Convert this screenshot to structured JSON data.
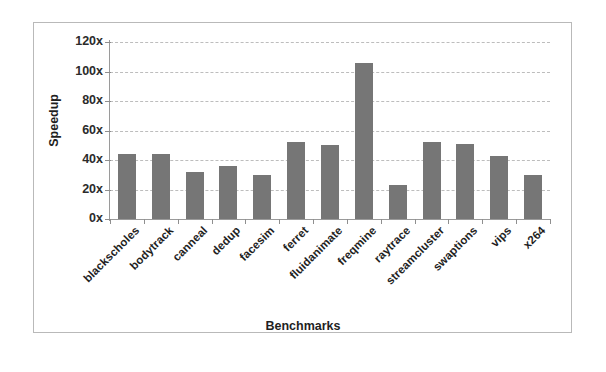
{
  "chart_data": {
    "type": "bar",
    "title": "",
    "xlabel": "Benchmarks",
    "ylabel": "Speedup",
    "categories": [
      "blackscholes",
      "bodytrack",
      "canneal",
      "dedup",
      "facesim",
      "ferret",
      "fluidanimate",
      "freqmine",
      "raytrace",
      "streamcluster",
      "swaptions",
      "vips",
      "x264"
    ],
    "values": [
      44,
      44,
      32,
      36,
      30,
      52,
      50,
      106,
      23,
      52,
      51,
      43,
      30
    ],
    "ylim": [
      0,
      120
    ],
    "ytick_values": [
      0,
      20,
      40,
      60,
      80,
      100,
      120
    ],
    "ytick_labels": [
      "0x",
      "20x",
      "40x",
      "60x",
      "80x",
      "100x",
      "120x"
    ],
    "grid": true,
    "grid_style": "dashed-horizontal",
    "legend": null,
    "bar_color": "#767676",
    "axis_color": "#9a9a9a",
    "grid_color": "#bdbdbd",
    "background": "#ffffff"
  }
}
